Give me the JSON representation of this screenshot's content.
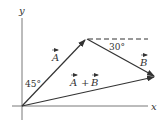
{
  "diagram": {
    "type": "vector-addition",
    "axes": {
      "x_label": "x",
      "y_label": "y"
    },
    "vectors": [
      {
        "id": "A",
        "label": "A",
        "angle_label": "45°",
        "angle_reference": "from y-axis"
      },
      {
        "id": "B",
        "label": "B",
        "angle_label": "30°",
        "angle_reference": "below horizontal"
      },
      {
        "id": "A+B",
        "label": "A + B",
        "parts": [
          "A",
          "+",
          "B"
        ]
      }
    ],
    "colors": {
      "line": "#333333",
      "dashed": "#333333",
      "background": "#ffffff"
    }
  }
}
